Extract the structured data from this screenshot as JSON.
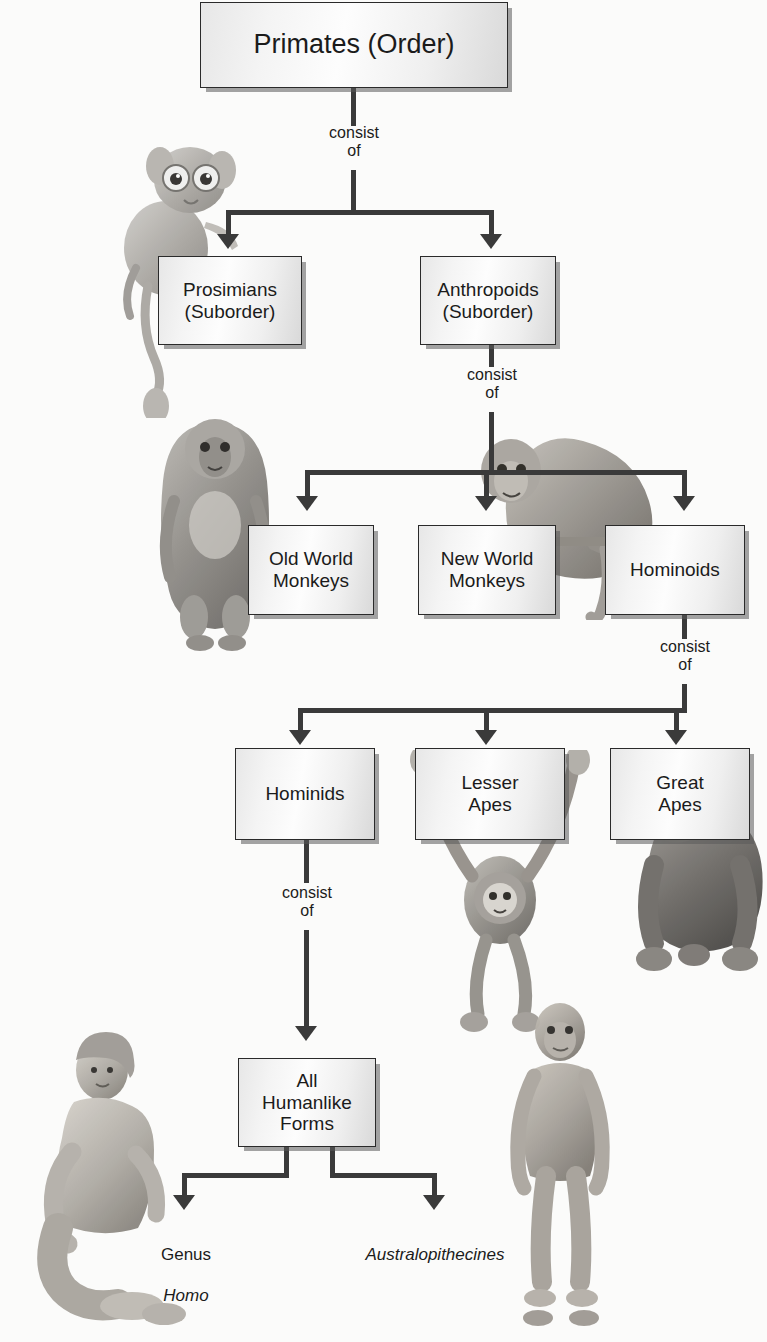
{
  "diagram": {
    "connector_label": "consist\nof",
    "nodes": [
      {
        "id": "primates",
        "label": "Primates (Order)",
        "level": 0
      },
      {
        "id": "prosimians",
        "label": "Prosimians\n(Suborder)",
        "level": 1
      },
      {
        "id": "anthropoids",
        "label": "Anthropoids\n(Suborder)",
        "level": 1
      },
      {
        "id": "old-world",
        "label": "Old World\nMonkeys",
        "level": 2
      },
      {
        "id": "new-world",
        "label": "New World\nMonkeys",
        "level": 2
      },
      {
        "id": "hominoids",
        "label": "Hominoids",
        "level": 2
      },
      {
        "id": "hominids",
        "label": "Hominids",
        "level": 3
      },
      {
        "id": "lesser-apes",
        "label": "Lesser\nApes",
        "level": 3
      },
      {
        "id": "great-apes",
        "label": "Great\nApes",
        "level": 3
      },
      {
        "id": "humanlike",
        "label": "All\nHumanlike\nForms",
        "level": 4
      }
    ],
    "connector_labels": [
      {
        "id": "consist-of-primates",
        "text": "consist\nof"
      },
      {
        "id": "consist-of-anthropoids",
        "text": "consist\nof"
      },
      {
        "id": "consist-of-hominoids",
        "text": "consist\nof"
      },
      {
        "id": "consist-of-hominids",
        "text": "consist\nof"
      }
    ],
    "leaves": [
      {
        "id": "genus-homo",
        "line1": "Genus",
        "line2": "Homo",
        "line2_italic": true
      },
      {
        "id": "australopithecines",
        "line1": "Australopithecines",
        "line2": "",
        "line1_italic": true
      }
    ],
    "illustrations": [
      {
        "id": "tarsier",
        "caption": "tarsier"
      },
      {
        "id": "baboon",
        "caption": "baboon"
      },
      {
        "id": "spider-monkey",
        "caption": "spider monkey"
      },
      {
        "id": "gibbon",
        "caption": "gibbon"
      },
      {
        "id": "gorilla",
        "caption": "gorilla"
      },
      {
        "id": "human-woman",
        "caption": "human"
      },
      {
        "id": "hominid-figure",
        "caption": "australopithecine"
      }
    ],
    "colors": {
      "background": "#fbfbfa",
      "box_border": "#2a2a2a",
      "box_fill_light": "#fdfdfd",
      "box_fill_dark": "#d9d9d9",
      "connector": "#3a3a3a",
      "text": "#1b1b1b"
    }
  }
}
